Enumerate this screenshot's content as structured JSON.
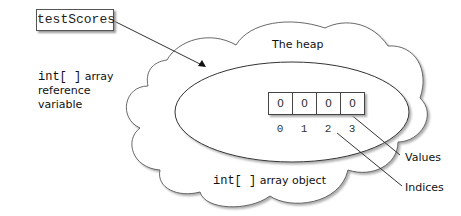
{
  "diagram": {
    "variable": {
      "name": "testScores"
    },
    "left_label": {
      "code": "int[ ]",
      "line1_rest": " array",
      "line2": "reference",
      "line3": "variable"
    },
    "heap": {
      "label": "The heap"
    },
    "array": {
      "values": [
        "0",
        "0",
        "0",
        "0"
      ],
      "indices": [
        "0",
        "1",
        "2",
        "3"
      ],
      "object_label_code": "int[ ]",
      "object_label_rest": " array object"
    },
    "annotations": {
      "values": "Values",
      "indices": "Indices"
    },
    "colors": {
      "line": "#333333",
      "shadow": "#aaaaaa",
      "background": "#ffffff"
    }
  }
}
